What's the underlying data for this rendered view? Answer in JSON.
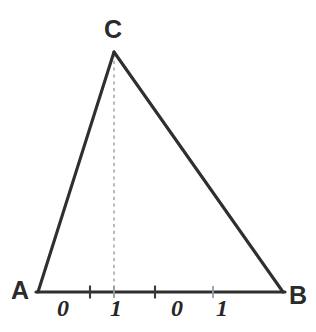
{
  "figure": {
    "type": "geometry-diagram",
    "background_color": "#ffffff",
    "stroke_color": "#2f2f2f",
    "dashed_color": "#a9a9a9",
    "vertices": [
      {
        "name": "A",
        "label": "A",
        "x": 38,
        "y": 292
      },
      {
        "name": "B",
        "label": "B",
        "x": 283,
        "y": 292
      },
      {
        "name": "C",
        "label": "C",
        "x": 114,
        "y": 52
      }
    ],
    "edges": [
      {
        "name": "side-AC",
        "from": "A",
        "to": "C"
      },
      {
        "name": "side-CB",
        "from": "C",
        "to": "B"
      },
      {
        "name": "side-AB",
        "from": "A",
        "to": "B"
      }
    ],
    "altitude": {
      "name": "altitude-C-to-AB",
      "from": "C",
      "foot_x": 114,
      "foot_y": 292,
      "style": "dashed"
    },
    "scale": {
      "name": "base-ruler",
      "axis_y": 292,
      "start_x": 38,
      "end_x": 283,
      "ticks": [
        {
          "x": 90,
          "major": true
        },
        {
          "x": 114,
          "major": false
        },
        {
          "x": 155,
          "major": true
        },
        {
          "x": 213,
          "major": false
        }
      ],
      "labels": [
        {
          "text": "0",
          "x": 57
        },
        {
          "text": "1",
          "x": 110
        },
        {
          "text": "0",
          "x": 171
        },
        {
          "text": "1",
          "x": 216
        }
      ]
    }
  }
}
